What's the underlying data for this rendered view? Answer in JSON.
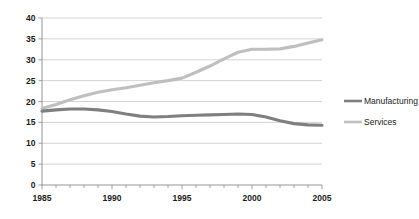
{
  "chart_data": {
    "type": "line",
    "title": "",
    "subtitle": "",
    "xlabel": "",
    "ylabel": "",
    "xlim": [
      1985,
      2005
    ],
    "ylim": [
      0,
      40
    ],
    "yticks": [
      0,
      5,
      10,
      15,
      20,
      25,
      30,
      35,
      40
    ],
    "ytick_labels": [
      "0",
      "5",
      "10",
      "15",
      "20",
      "25",
      "30",
      "35",
      "40"
    ],
    "xticks": [
      1985,
      1986,
      1987,
      1988,
      1989,
      1990,
      1991,
      1992,
      1993,
      1994,
      1995,
      1996,
      1997,
      1998,
      1999,
      2000,
      2001,
      2002,
      2003,
      2004,
      2005
    ],
    "xtick_labels_shown": [
      "1985",
      "1990",
      "1995",
      "2000",
      "2005"
    ],
    "xtick_labeled_values": [
      1985,
      1990,
      1995,
      2000,
      2005
    ],
    "grid": true,
    "grid_axis": "y",
    "legend_position": "right",
    "x": [
      1985,
      1986,
      1987,
      1988,
      1989,
      1990,
      1991,
      1992,
      1993,
      1994,
      1995,
      1996,
      1997,
      1998,
      1999,
      2000,
      2001,
      2002,
      2003,
      2004,
      2005
    ],
    "series": [
      {
        "name": "Manufacturing",
        "color": "#7f7f7f",
        "values": [
          17.7,
          18.0,
          18.2,
          18.2,
          18.0,
          17.6,
          17.0,
          16.5,
          16.3,
          16.4,
          16.6,
          16.7,
          16.8,
          16.9,
          17.0,
          16.9,
          16.3,
          15.4,
          14.7,
          14.4,
          14.3
        ]
      },
      {
        "name": "Services",
        "color": "#bfbfbf",
        "values": [
          18.3,
          19.3,
          20.4,
          21.4,
          22.2,
          22.8,
          23.3,
          23.9,
          24.5,
          25.0,
          25.6,
          27.0,
          28.5,
          30.2,
          31.8,
          32.5,
          32.5,
          32.6,
          33.2,
          34.0,
          34.8
        ]
      }
    ]
  },
  "legend": {
    "entries": [
      {
        "label": "Manufacturing",
        "swatch_name": "legend-swatch-manufacturing"
      },
      {
        "label": "Services",
        "swatch_name": "legend-swatch-services"
      }
    ]
  },
  "colors": {
    "manufacturing": "#7f7f7f",
    "services": "#bfbfbf",
    "gridline": "#c8c8c8",
    "axis": "#8a8a8a",
    "text": "#1a1a1a",
    "background": "#ffffff"
  }
}
